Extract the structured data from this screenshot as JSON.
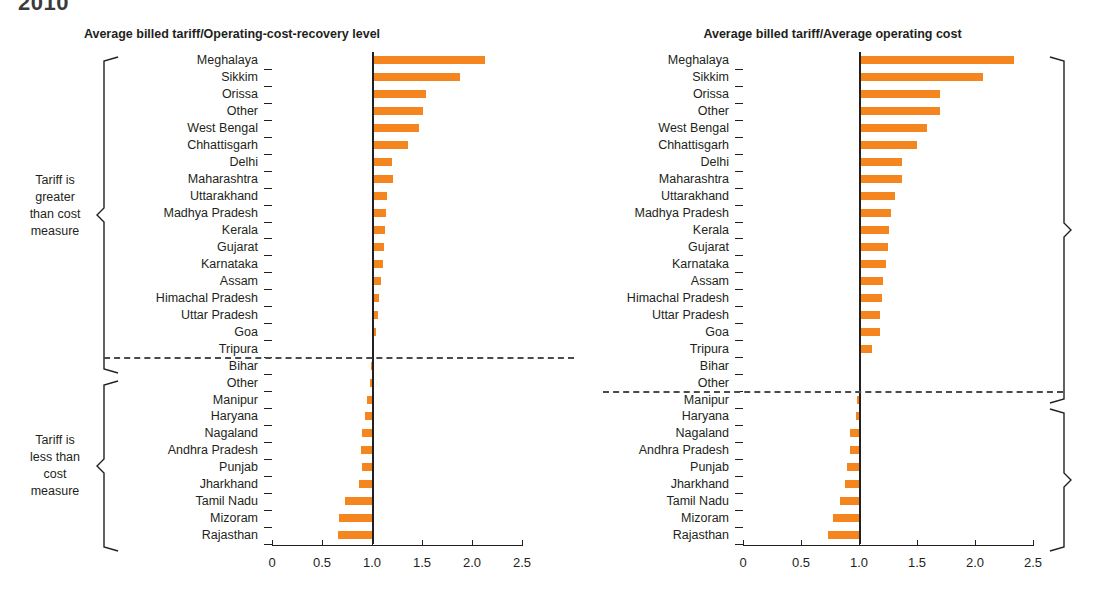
{
  "page": {
    "clipped_heading": "2010"
  },
  "brackets": {
    "upper_label": "Tariff is\ngreater\nthan cost\nmeasure",
    "upper_lines": [
      "Tariff is",
      "greater",
      "than cost",
      "measure"
    ],
    "lower_lines": [
      "Tariff is",
      "less than",
      "cost",
      "measure"
    ]
  },
  "colors": {
    "bar": "#f5861f",
    "axis": "#231f20",
    "dashed_divider": "#4a4a4a"
  },
  "chart_data": [
    {
      "type": "bar",
      "orientation": "horizontal",
      "title": "Average billed tariff/Operating-cost-recovery level",
      "xlabel": "",
      "ylabel": "",
      "xlim": [
        0,
        2.5
      ],
      "baseline": 1.0,
      "grid": false,
      "legend": "none",
      "ticks": [
        0,
        0.5,
        1.0,
        1.5,
        2.0,
        2.5
      ],
      "tick_labels": [
        "0",
        "0.5",
        "1.0",
        "1.5",
        "2.0",
        "2.5"
      ],
      "divider_after_category": "Tripura",
      "categories": [
        "Meghalaya",
        "Sikkim",
        "Orissa",
        "Other",
        "West Bengal",
        "Chhattisgarh",
        "Delhi",
        "Maharashtra",
        "Uttarakhand",
        "Madhya Pradesh",
        "Kerala",
        "Gujarat",
        "Karnataka",
        "Assam",
        "Himachal Pradesh",
        "Uttar Pradesh",
        "Goa",
        "Tripura",
        "Bihar",
        "Other",
        "Manipur",
        "Haryana",
        "Nagaland",
        "Andhra Pradesh",
        "Punjab",
        "Jharkhand",
        "Tamil Nadu",
        "Mizoram",
        "Rajasthan"
      ],
      "values": [
        2.13,
        1.88,
        1.54,
        1.51,
        1.47,
        1.36,
        1.2,
        1.21,
        1.15,
        1.14,
        1.13,
        1.12,
        1.11,
        1.09,
        1.07,
        1.06,
        1.04,
        1.0,
        0.99,
        0.98,
        0.95,
        0.93,
        0.9,
        0.89,
        0.9,
        0.87,
        0.73,
        0.67,
        0.66
      ]
    },
    {
      "type": "bar",
      "orientation": "horizontal",
      "title": "Average billed tariff/Average operating cost",
      "xlabel": "",
      "ylabel": "",
      "xlim": [
        0,
        2.5
      ],
      "baseline": 1.0,
      "grid": false,
      "legend": "none",
      "ticks": [
        0,
        0.5,
        1.0,
        1.5,
        2.0,
        2.5
      ],
      "tick_labels": [
        "0",
        "0.5",
        "1.0",
        "1.5",
        "2.0",
        "2.5"
      ],
      "divider_after_category": "Other",
      "categories": [
        "Meghalaya",
        "Sikkim",
        "Orissa",
        "Other",
        "West Bengal",
        "Chhattisgarh",
        "Delhi",
        "Maharashtra",
        "Uttarakhand",
        "Madhya Pradesh",
        "Kerala",
        "Gujarat",
        "Karnataka",
        "Assam",
        "Himachal Pradesh",
        "Uttar Pradesh",
        "Goa",
        "Tripura",
        "Bihar",
        "Other",
        "Manipur",
        "Haryana",
        "Nagaland",
        "Andhra Pradesh",
        "Punjab",
        "Jharkhand",
        "Tamil Nadu",
        "Mizoram",
        "Rajasthan"
      ],
      "values": [
        2.34,
        2.07,
        1.7,
        1.7,
        1.59,
        1.5,
        1.37,
        1.37,
        1.31,
        1.28,
        1.26,
        1.25,
        1.23,
        1.21,
        1.2,
        1.18,
        1.18,
        1.11,
        1.02,
        1.01,
        0.98,
        0.97,
        0.92,
        0.92,
        0.9,
        0.88,
        0.84,
        0.78,
        0.73
      ]
    }
  ]
}
